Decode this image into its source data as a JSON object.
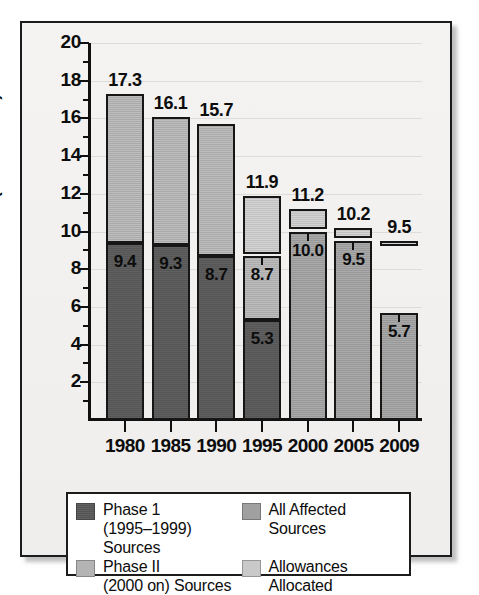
{
  "chart_data": {
    "type": "bar",
    "title": "",
    "xlabel": "",
    "ylabel": "SO2 Emissions (million tons)",
    "ylim": [
      0,
      20
    ],
    "ytick_labels": [
      "20",
      "18",
      "16",
      "14",
      "12",
      "10",
      "8",
      "6",
      "4",
      "2"
    ],
    "ytick_values": [
      20,
      18,
      16,
      14,
      12,
      10,
      8,
      6,
      4,
      2
    ],
    "grid": true,
    "legend_position": "below-axes",
    "categories": [
      "1980",
      "1985",
      "1990",
      "1995",
      "2000",
      "2005",
      "2009"
    ],
    "totals": [
      17.3,
      16.1,
      15.7,
      11.9,
      11.2,
      10.2,
      9.5
    ],
    "series": [
      {
        "name": "Phase 1 (1995–1999) Sources",
        "key": "phase1",
        "color": "#595959",
        "values": [
          9.4,
          9.3,
          8.7,
          5.3,
          null,
          null,
          null
        ]
      },
      {
        "name": "Phase II (2000 on) Sources",
        "key": "phase2",
        "color": "#b4b4b4",
        "values": [
          7.9,
          6.8,
          7.0,
          3.4,
          null,
          null,
          null
        ]
      },
      {
        "name": "All Affected Sources",
        "key": "all_affected",
        "color": "#a0a0a0",
        "values": [
          null,
          null,
          null,
          null,
          10.0,
          9.5,
          5.7
        ]
      },
      {
        "name": "Allowances Allocated",
        "key": "allowances",
        "color": "#c9c9c9",
        "values": [
          null,
          null,
          null,
          11.9,
          11.2,
          10.2,
          9.5
        ]
      }
    ],
    "bars": [
      {
        "category": "1980",
        "total_label": "17.3",
        "segments": [
          {
            "key": "phase1",
            "from": 0,
            "to": 9.4,
            "label": "9.4"
          },
          {
            "key": "phase2",
            "from": 9.4,
            "to": 17.3,
            "label": ""
          }
        ]
      },
      {
        "category": "1985",
        "total_label": "16.1",
        "segments": [
          {
            "key": "phase1",
            "from": 0,
            "to": 9.3,
            "label": "9.3"
          },
          {
            "key": "phase2",
            "from": 9.3,
            "to": 16.1,
            "label": ""
          }
        ]
      },
      {
        "category": "1990",
        "total_label": "15.7",
        "segments": [
          {
            "key": "phase1",
            "from": 0,
            "to": 8.7,
            "label": "8.7"
          },
          {
            "key": "phase2",
            "from": 8.7,
            "to": 15.7,
            "label": ""
          }
        ]
      },
      {
        "category": "1995",
        "total_label": "11.9",
        "segments": [
          {
            "key": "phase1",
            "from": 0,
            "to": 5.3,
            "label": "5.3"
          },
          {
            "key": "phase2",
            "from": 5.3,
            "to": 8.7,
            "label": "8.7"
          },
          {
            "key": "allowances",
            "from": 8.8,
            "to": 11.9,
            "label": ""
          }
        ]
      },
      {
        "category": "2000",
        "total_label": "11.2",
        "segments": [
          {
            "key": "all_affected",
            "from": 0,
            "to": 10.0,
            "label": "10.0"
          },
          {
            "key": "allowances",
            "from": 10.15,
            "to": 11.2,
            "label": ""
          }
        ]
      },
      {
        "category": "2005",
        "total_label": "10.2",
        "segments": [
          {
            "key": "all_affected",
            "from": 0,
            "to": 9.5,
            "label": "9.5"
          },
          {
            "key": "allowances",
            "from": 9.65,
            "to": 10.2,
            "label": ""
          }
        ]
      },
      {
        "category": "2009",
        "total_label": "9.5",
        "segments": [
          {
            "key": "all_affected",
            "from": 0,
            "to": 5.7,
            "label": "5.7"
          },
          {
            "key": "allowances",
            "from": 9.25,
            "to": 9.5,
            "label": ""
          }
        ]
      }
    ]
  },
  "axis": {
    "y_title": "SO2 Emissions (million tons)"
  },
  "legend": {
    "items": [
      {
        "swatch": "p1",
        "line1": "Phase 1",
        "line2": "(1995–1999) Sources"
      },
      {
        "swatch": "aff",
        "line1": "All Affected",
        "line2": "Sources"
      },
      {
        "swatch": "p2",
        "line1": "Phase II",
        "line2": "(2000 on) Sources"
      },
      {
        "swatch": "alw",
        "line1": "Allowances",
        "line2": "Allocated"
      }
    ]
  }
}
